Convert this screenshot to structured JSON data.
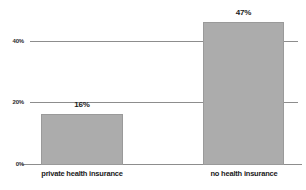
{
  "chart_data": {
    "type": "bar",
    "title": "",
    "xlabel": "",
    "ylabel": "",
    "categories": [
      "private health insurance",
      "no health insurance"
    ],
    "values": [
      16,
      47
    ],
    "value_labels": [
      "16%",
      "47%"
    ],
    "ylim": [
      0,
      50
    ],
    "yticks": [
      0,
      20,
      40
    ],
    "ytick_labels": [
      "0%",
      "20%",
      "40%"
    ],
    "grid": true,
    "legend": "none",
    "bar_color": "#acacac",
    "gridline_color": "#8d8d8d",
    "text_color": "#1a1a1a"
  },
  "axis": {
    "ytick_0": "0%",
    "ytick_20": "20%",
    "ytick_40": "40%"
  },
  "bars": [
    {
      "category": "private health insurance",
      "label": "16%",
      "value": 16
    },
    {
      "category": "no health insurance",
      "label": "47%",
      "value": 47
    }
  ]
}
